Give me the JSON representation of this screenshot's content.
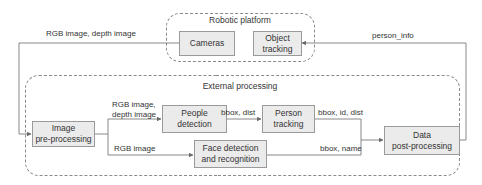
{
  "diagram": {
    "groups": {
      "robotic_platform": {
        "title": "Robotic platform"
      },
      "external_processing": {
        "title": "External processing"
      }
    },
    "nodes": {
      "cameras": "Cameras",
      "object_tracking": "Object\ntracking",
      "image_preprocessing": "Image\npre-processing",
      "people_detection": "People\ndetection",
      "person_tracking": "Person\ntracking",
      "face_detection": "Face detection\nand recognition",
      "data_postprocessing": "Data\npost-processing"
    },
    "edge_labels": {
      "cameras_to_preprocessing": "RGB image, depth image",
      "postprocessing_to_object_tracking": "person_info",
      "preprocessing_to_people_detection": "RGB image,\ndepth image",
      "preprocessing_to_face_detection": "RGB image",
      "people_detection_to_person_tracking": "bbox, dist",
      "person_tracking_to_postprocessing": "bbox, id, dist",
      "face_detection_to_postprocessing": "bbox, name"
    },
    "colors": {
      "node_fill": "#ebebeb",
      "node_border": "#9a9a9a",
      "line": "#7a7a7a",
      "dashed_border": "#8a8a8a"
    }
  }
}
